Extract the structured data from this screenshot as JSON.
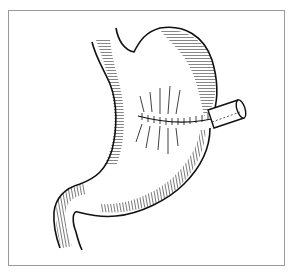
{
  "illustration": {
    "subject": "stomach-with-sutured-incision-and-tube",
    "style": "black ink line art with hatching",
    "colors": {
      "ink": "#111111",
      "border": "#9a9a9a",
      "background": "#ffffff"
    }
  }
}
